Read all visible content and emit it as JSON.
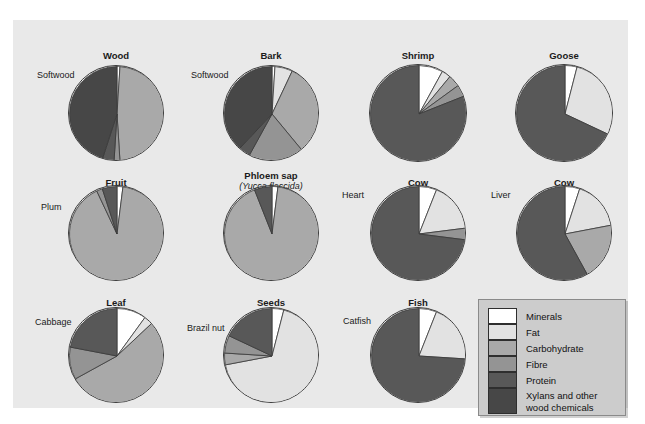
{
  "figure": {
    "top_cropped_caption": "",
    "background_color": "#e9e9e9",
    "page_color": "#ffffff"
  },
  "legend": {
    "title": "",
    "items": [
      {
        "label": "Minerals",
        "color": "#ffffff"
      },
      {
        "label": "Fat",
        "color": "#e2e2e2"
      },
      {
        "label": "Carbohydrate",
        "color": "#a9a9a9"
      },
      {
        "label": "Fibre",
        "color": "#949494"
      },
      {
        "label": "Protein",
        "color": "#585858"
      },
      {
        "label": "Xylans and other\nwood chemicals",
        "color": "#474747"
      }
    ]
  },
  "chart_data": {
    "type": "pie",
    "categories": [
      "Minerals",
      "Fat",
      "Carbohydrate",
      "Fibre",
      "Protein",
      "Xylans and other wood chemicals"
    ],
    "colors": [
      "#ffffff",
      "#e2e2e2",
      "#a9a9a9",
      "#949494",
      "#585858",
      "#474747"
    ],
    "units": "percent of dry mass",
    "charts": [
      {
        "title": "Wood",
        "subtitle": "",
        "sidelabel": "Softwood",
        "values": [
          1,
          0,
          48,
          2,
          4,
          45
        ]
      },
      {
        "title": "Bark",
        "subtitle": "",
        "sidelabel": "Softwood",
        "values": [
          1,
          6,
          32,
          19,
          4,
          38
        ]
      },
      {
        "title": "Shrimp",
        "subtitle": "",
        "sidelabel": "",
        "values": [
          8,
          3,
          4,
          4,
          81,
          0
        ]
      },
      {
        "title": "Goose",
        "subtitle": "",
        "sidelabel": "",
        "values": [
          4,
          28,
          0,
          0,
          68,
          0
        ]
      },
      {
        "title": "Fruit",
        "subtitle": "",
        "sidelabel": "Plum",
        "values": [
          2,
          0,
          91,
          2,
          5,
          0
        ]
      },
      {
        "title": "Phloem sap",
        "subtitle": "(Yucca flaccida)",
        "sidelabel": "",
        "values": [
          2,
          0,
          92,
          0,
          6,
          0
        ]
      },
      {
        "title": "Cow",
        "subtitle": "",
        "sidelabel": "Heart",
        "values": [
          6,
          17,
          0,
          4,
          73,
          0
        ]
      },
      {
        "title": "Cow",
        "subtitle": "",
        "sidelabel": "Liver",
        "values": [
          5,
          17,
          20,
          0,
          58,
          0
        ]
      },
      {
        "title": "Leaf",
        "subtitle": "",
        "sidelabel": "Cabbage",
        "values": [
          10,
          3,
          54,
          11,
          22,
          0
        ]
      },
      {
        "title": "Seeds",
        "subtitle": "",
        "sidelabel": "Brazil nut",
        "values": [
          4,
          68,
          4,
          6,
          18,
          0
        ]
      },
      {
        "title": "Fish",
        "subtitle": "",
        "sidelabel": "Catfish",
        "values": [
          6,
          20,
          0,
          0,
          74,
          0
        ]
      }
    ]
  },
  "layout": {
    "positions": [
      {
        "cx": 103,
        "cy": 93,
        "r": 48,
        "label_x": 24,
        "label_y": 50,
        "title_y": 30
      },
      {
        "cx": 258,
        "cy": 93,
        "r": 48,
        "label_x": 178,
        "label_y": 50,
        "title_y": 30
      },
      {
        "cx": 405,
        "cy": 93,
        "r": 49,
        "label_x": 0,
        "label_y": 0,
        "title_y": 30
      },
      {
        "cx": 551,
        "cy": 93,
        "r": 49,
        "label_x": 0,
        "label_y": 0,
        "title_y": 30
      },
      {
        "cx": 103,
        "cy": 213,
        "r": 48,
        "label_x": 28,
        "label_y": 182,
        "title_y": 157
      },
      {
        "cx": 258,
        "cy": 213,
        "r": 48,
        "label_x": 0,
        "label_y": 0,
        "title_y": 150
      },
      {
        "cx": 405,
        "cy": 213,
        "r": 48,
        "label_x": 329,
        "label_y": 170,
        "title_y": 157
      },
      {
        "cx": 551,
        "cy": 213,
        "r": 48,
        "label_x": 478,
        "label_y": 170,
        "title_y": 157
      },
      {
        "cx": 103,
        "cy": 335,
        "r": 48,
        "label_x": 22,
        "label_y": 297,
        "title_y": 277
      },
      {
        "cx": 258,
        "cy": 335,
        "r": 48,
        "label_x": 174,
        "label_y": 303,
        "title_y": 277
      },
      {
        "cx": 405,
        "cy": 335,
        "r": 48,
        "label_x": 330,
        "label_y": 296,
        "title_y": 277
      }
    ]
  }
}
